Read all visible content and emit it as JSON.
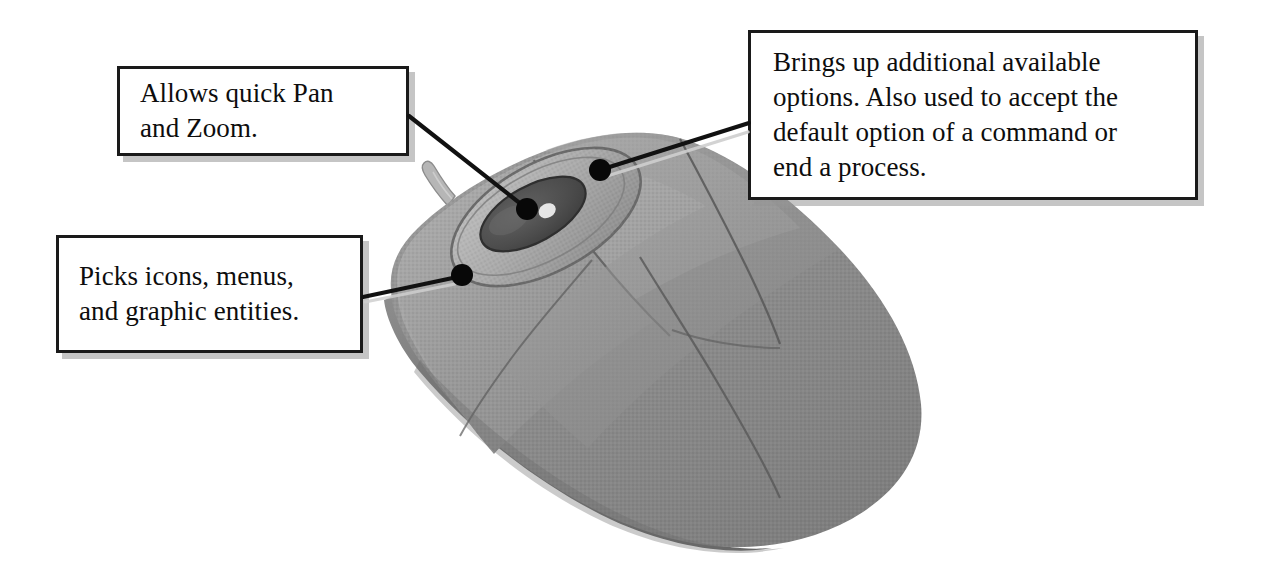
{
  "figure": {
    "background_color": "#ffffff"
  },
  "callouts": [
    {
      "id": "pan-zoom",
      "text": "Allows quick Pan\nand Zoom.",
      "target": "scroll-wheel",
      "box": {
        "x": 117,
        "y": 66,
        "w": 292,
        "h": 90
      },
      "anchor_dot": {
        "x": 525,
        "y": 207
      }
    },
    {
      "id": "picks",
      "text": "Picks icons, menus,\nand graphic entities.",
      "target": "left-button",
      "box": {
        "x": 56,
        "y": 235,
        "w": 307,
        "h": 118
      },
      "anchor_dot": {
        "x": 460,
        "y": 275
      }
    },
    {
      "id": "options",
      "text": "Brings up additional available\noptions. Also used to accept the\ndefault option of a command or\nend a process.",
      "target": "right-button",
      "box": {
        "x": 748,
        "y": 30,
        "w": 450,
        "h": 170
      },
      "anchor_dot": {
        "x": 600,
        "y": 170
      }
    }
  ],
  "mouse": {
    "parts": [
      {
        "name": "body",
        "color": "#8b8b8b"
      },
      {
        "name": "top-shell-highlight",
        "color": "#a9a9a9"
      },
      {
        "name": "left-button",
        "color": "#9d9d9d"
      },
      {
        "name": "right-button",
        "color": "#949494"
      },
      {
        "name": "scroll-wheel",
        "color": "#4a4a4a"
      },
      {
        "name": "scroll-wheel-bezel",
        "color": "#b2b2b2"
      },
      {
        "name": "cable",
        "color": "#b9b9b9"
      },
      {
        "name": "base-skirt",
        "color": "#6f6f6f"
      }
    ]
  },
  "styles": {
    "box_border_color": "#1a1a1a",
    "box_fill": "#ffffff",
    "box_shadow_color": "#969696",
    "leader_line_color": "#111111",
    "leader_dot_color": "#080808",
    "text_color": "#0d0d0d"
  }
}
